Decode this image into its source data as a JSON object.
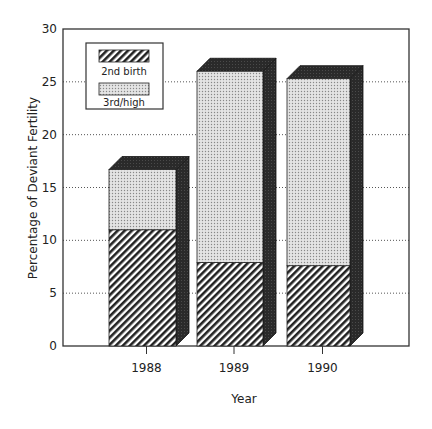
{
  "chart_data": {
    "type": "bar",
    "stacked": true,
    "style": "3d",
    "title": "",
    "xlabel": "Year",
    "ylabel": "Percentage of Deviant Fertility",
    "ylim": [
      0,
      30
    ],
    "yticks": [
      0,
      5,
      10,
      15,
      20,
      25,
      30
    ],
    "categories": [
      "1988",
      "1989",
      "1990"
    ],
    "series": [
      {
        "name": "2nd birth",
        "pattern": "diagonal-hatch",
        "values": [
          11.0,
          7.9,
          7.6
        ]
      },
      {
        "name": "3rd/high",
        "pattern": "dotted",
        "values": [
          5.7,
          18.1,
          17.7
        ]
      }
    ],
    "totals": [
      16.7,
      26.0,
      25.3
    ],
    "grid": "horizontal-dotted",
    "legend_position": "upper-left-inside"
  },
  "labels": {
    "xlabel": "Year",
    "ylabel": "Percentage of Deviant Fertility",
    "legend": [
      "2nd birth",
      "3rd/high"
    ],
    "yticks": [
      "0",
      "5",
      "10",
      "15",
      "20",
      "25",
      "30"
    ],
    "categories": [
      "1988",
      "1989",
      "1990"
    ]
  }
}
